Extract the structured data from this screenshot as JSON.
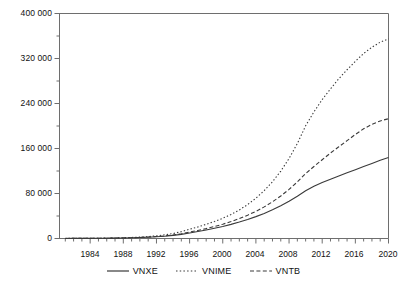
{
  "chart_data": {
    "type": "line",
    "title": "",
    "xlabel": "",
    "ylabel": "",
    "xlim": [
      1980.3,
      2020
    ],
    "ylim": [
      0,
      400000
    ],
    "grid": false,
    "legend_position": "bottom-center",
    "y_ticks": [
      0,
      80000,
      160000,
      240000,
      320000,
      400000
    ],
    "y_tick_labels": [
      "0",
      "80 000",
      "160 000",
      "240 000",
      "320 000",
      "400 000"
    ],
    "y_minor_tick_interval": 40000,
    "x_ticks": [
      1984,
      1988,
      1992,
      1996,
      2000,
      2004,
      2008,
      2012,
      2016,
      2020
    ],
    "x_tick_labels": [
      "1984",
      "1988",
      "1992",
      "1996",
      "2000",
      "2004",
      "2008",
      "2012",
      "2016",
      "2020"
    ],
    "x_minor_tick_interval": 1,
    "x": [
      1981,
      1982,
      1983,
      1984,
      1985,
      1986,
      1987,
      1988,
      1989,
      1990,
      1991,
      1992,
      1993,
      1994,
      1995,
      1996,
      1997,
      1998,
      1999,
      2000,
      2001,
      2002,
      2003,
      2004,
      2005,
      2006,
      2007,
      2008,
      2009,
      2010,
      2011,
      2012,
      2013,
      2014,
      2015,
      2016,
      2017,
      2018,
      2019,
      2020
    ],
    "series": [
      {
        "name": "VNXE",
        "style": "solid",
        "color": "#3a3a3a",
        "values": [
          120,
          160,
          215,
          290,
          390,
          520,
          700,
          940,
          1260,
          1690,
          2270,
          3040,
          4080,
          5470,
          7330,
          9830,
          12400,
          15100,
          18100,
          21400,
          25100,
          29200,
          33800,
          38900,
          44600,
          51000,
          58200,
          66200,
          75100,
          84900,
          93000,
          99500,
          105500,
          111200,
          116900,
          122400,
          128000,
          133500,
          139000,
          144000
        ]
      },
      {
        "name": "VNIME",
        "style": "dotted",
        "color": "#3a3a3a",
        "values": [
          150,
          205,
          280,
          385,
          525,
          720,
          985,
          1350,
          1840,
          2520,
          3450,
          4720,
          6460,
          8840,
          12100,
          16500,
          20600,
          25200,
          30300,
          36000,
          42800,
          50800,
          60300,
          71600,
          85000,
          100900,
          119800,
          142200,
          168800,
          200400,
          225000,
          247000,
          266000,
          284000,
          300000,
          315000,
          329000,
          340000,
          349000,
          355000
        ]
      },
      {
        "name": "VNTB",
        "style": "dashed",
        "color": "#3a3a3a",
        "values": [
          125,
          170,
          230,
          310,
          420,
          565,
          765,
          1030,
          1390,
          1880,
          2540,
          3430,
          4630,
          6250,
          8440,
          11400,
          14300,
          17600,
          21300,
          25400,
          30100,
          35400,
          41400,
          48300,
          56200,
          65200,
          75500,
          87200,
          100500,
          115500,
          128000,
          140000,
          152000,
          163000,
          174000,
          185000,
          195000,
          203000,
          209000,
          213000
        ]
      }
    ]
  },
  "legend": {
    "items": [
      {
        "label": "VNXE",
        "style": "solid"
      },
      {
        "label": "VNIME",
        "style": "dotted"
      },
      {
        "label": "VNTB",
        "style": "dashed"
      }
    ]
  }
}
